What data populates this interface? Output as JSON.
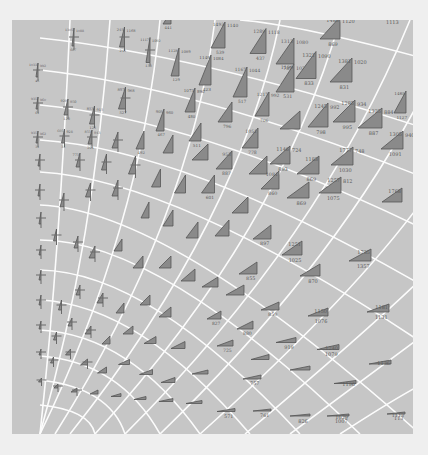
{
  "figure": {
    "background": "#efefef",
    "panel_color": "#c6c6c6",
    "grid_color": "#ffffff",
    "glyph_fill": "#8a8a8a",
    "glyph_stroke": "#555555",
    "label_color": "#5a5a5a"
  },
  "glyphs": [
    {
      "x": 73,
      "y": 37,
      "w": 2,
      "h": 18,
      "top": "1305",
      "right": "1088",
      "bottom": "667"
    },
    {
      "x": 122,
      "y": 37,
      "w": 5,
      "h": 20,
      "top": "245",
      "right": "1168",
      "bottom": "245"
    },
    {
      "x": 148,
      "y": 50,
      "w": 4,
      "h": 25,
      "top": "1117",
      "right": "1092",
      "bottom": "133"
    },
    {
      "x": 175,
      "y": 62,
      "w": 8,
      "h": 28,
      "top": "1128",
      "right": "1089",
      "bottom": "129"
    },
    {
      "x": 167,
      "y": 18,
      "w": 8,
      "h": 12,
      "top": "",
      "right": "",
      "bottom": "441"
    },
    {
      "x": 205,
      "y": 70,
      "w": 12,
      "h": 30,
      "top": "1149",
      "right": "1084",
      "bottom": "423"
    },
    {
      "x": 218,
      "y": 35,
      "w": 14,
      "h": 26,
      "top": "1493",
      "right": "1140",
      "bottom": "539"
    },
    {
      "x": 240,
      "y": 82,
      "w": 14,
      "h": 30,
      "top": "1167",
      "right": "1044",
      "bottom": "517"
    },
    {
      "x": 258,
      "y": 41,
      "w": 16,
      "h": 25,
      "top": "1289",
      "right": "1118",
      "bottom": "437"
    },
    {
      "x": 262,
      "y": 104,
      "w": 14,
      "h": 24,
      "top": "1217",
      "right": "992",
      "bottom": "706"
    },
    {
      "x": 285,
      "y": 51,
      "w": 18,
      "h": 26,
      "top": "1313",
      "right": "1080",
      "bottom": "785"
    },
    {
      "x": 285,
      "y": 78,
      "w": 18,
      "h": 28,
      "top": "1199",
      "right": "1020",
      "bottom": "531"
    },
    {
      "x": 306,
      "y": 65,
      "w": 20,
      "h": 27,
      "top": "1321",
      "right": "1090",
      "bottom": "833"
    },
    {
      "x": 318,
      "y": 115,
      "w": 20,
      "h": 24,
      "top": "1245",
      "right": "992",
      "bottom": "798"
    },
    {
      "x": 341,
      "y": 70,
      "w": 22,
      "h": 24,
      "top": "1381",
      "right": "1020",
      "bottom": "831"
    },
    {
      "x": 330,
      "y": 28,
      "w": 20,
      "h": 22,
      "top": "1485",
      "right": "1120",
      "bottom": "869"
    },
    {
      "x": 344,
      "y": 111,
      "w": 22,
      "h": 22,
      "top": "1285",
      "right": "934",
      "bottom": "995"
    },
    {
      "x": 370,
      "y": 118,
      "w": 24,
      "h": 20,
      "top": "1325",
      "right": "884",
      "bottom": "887"
    },
    {
      "x": 400,
      "y": 102,
      "w": 12,
      "h": 22,
      "top": "1465",
      "right": "",
      "bottom": "1127"
    },
    {
      "x": 392,
      "y": 140,
      "w": 22,
      "h": 18,
      "top": "1305",
      "right": "940",
      "bottom": "1091"
    },
    {
      "x": 37,
      "y": 70,
      "w": 2,
      "h": 14,
      "top": "1033",
      "right": "992",
      "bottom": "45"
    },
    {
      "x": 37,
      "y": 103,
      "w": 2,
      "h": 12,
      "top": "935",
      "right": "960",
      "bottom": "61"
    },
    {
      "x": 66,
      "y": 107,
      "w": 4,
      "h": 16,
      "top": "929",
      "right": "950",
      "bottom": "120"
    },
    {
      "x": 92,
      "y": 115,
      "w": 5,
      "h": 18,
      "top": "853",
      "right": "915",
      "bottom": "125"
    },
    {
      "x": 122,
      "y": 98,
      "w": 7,
      "h": 22,
      "top": "897",
      "right": "968",
      "bottom": "527"
    },
    {
      "x": 160,
      "y": 120,
      "w": 8,
      "h": 22,
      "top": "905",
      "right": "960",
      "bottom": "467"
    },
    {
      "x": 190,
      "y": 100,
      "w": 10,
      "h": 24,
      "top": "1073",
      "right": "890",
      "bottom": "480"
    },
    {
      "x": 225,
      "y": 112,
      "w": 14,
      "h": 20,
      "top": "",
      "right": "",
      "bottom": "796"
    },
    {
      "x": 37,
      "y": 137,
      "w": 2,
      "h": 12,
      "top": "935",
      "right": "962",
      "bottom": "31"
    },
    {
      "x": 63,
      "y": 136,
      "w": 3,
      "h": 14,
      "top": "605",
      "right": "928",
      "bottom": "31"
    },
    {
      "x": 90,
      "y": 137,
      "w": 4,
      "h": 14,
      "top": "853",
      "right": "943",
      "bottom": "201"
    },
    {
      "x": 115,
      "y": 140,
      "w": 6,
      "h": 16,
      "top": "",
      "right": "",
      "bottom": ""
    },
    {
      "x": 140,
      "y": 140,
      "w": 8,
      "h": 18,
      "top": "",
      "right": "",
      "bottom": "492"
    },
    {
      "x": 168,
      "y": 144,
      "w": 10,
      "h": 18,
      "top": "",
      "right": "",
      "bottom": ""
    },
    {
      "x": 195,
      "y": 132,
      "w": 12,
      "h": 18,
      "top": "",
      "right": "",
      "bottom": "511"
    },
    {
      "x": 200,
      "y": 152,
      "w": 16,
      "h": 16,
      "top": "",
      "right": "",
      "bottom": ""
    },
    {
      "x": 39,
      "y": 160,
      "w": 2,
      "h": 12,
      "top": "",
      "right": "",
      "bottom": ""
    },
    {
      "x": 78,
      "y": 160,
      "w": 4,
      "h": 14,
      "top": "773",
      "right": "",
      "bottom": ""
    },
    {
      "x": 104,
      "y": 162,
      "w": 5,
      "h": 16,
      "top": "",
      "right": "",
      "bottom": ""
    },
    {
      "x": 132,
      "y": 165,
      "w": 7,
      "h": 18,
      "top": "",
      "right": "",
      "bottom": ""
    },
    {
      "x": 156,
      "y": 178,
      "w": 9,
      "h": 18,
      "top": "",
      "right": "",
      "bottom": ""
    },
    {
      "x": 180,
      "y": 184,
      "w": 11,
      "h": 18,
      "top": "",
      "right": "",
      "bottom": ""
    },
    {
      "x": 208,
      "y": 184,
      "w": 13,
      "h": 18,
      "top": "",
      "right": "",
      "bottom": "601"
    },
    {
      "x": 224,
      "y": 160,
      "w": 16,
      "h": 18,
      "top": "953",
      "right": "",
      "bottom": "887"
    },
    {
      "x": 250,
      "y": 138,
      "w": 16,
      "h": 20,
      "top": "1051",
      "right": "",
      "bottom": "778"
    },
    {
      "x": 258,
      "y": 165,
      "w": 18,
      "h": 18,
      "top": "",
      "right": "",
      "bottom": ""
    },
    {
      "x": 280,
      "y": 155,
      "w": 20,
      "h": 18,
      "top": "1146",
      "right": "724",
      "bottom": "893"
    },
    {
      "x": 290,
      "y": 120,
      "w": 20,
      "h": 18,
      "top": "",
      "right": "",
      "bottom": ""
    },
    {
      "x": 270,
      "y": 180,
      "w": 18,
      "h": 18,
      "top": "1081",
      "right": "",
      "bottom": "860"
    },
    {
      "x": 308,
      "y": 165,
      "w": 22,
      "h": 18,
      "top": "1183",
      "right": "",
      "bottom": "869"
    },
    {
      "x": 342,
      "y": 156,
      "w": 22,
      "h": 18,
      "top": "1777",
      "right": "748",
      "bottom": "1030"
    },
    {
      "x": 330,
      "y": 185,
      "w": 22,
      "h": 16,
      "top": "1257",
      "right": "812",
      "bottom": "1075"
    },
    {
      "x": 298,
      "y": 190,
      "w": 22,
      "h": 16,
      "top": "",
      "right": "",
      "bottom": "869"
    },
    {
      "x": 392,
      "y": 195,
      "w": 20,
      "h": 14,
      "top": "1768",
      "right": "",
      "bottom": ""
    },
    {
      "x": 39,
      "y": 190,
      "w": 2,
      "h": 12,
      "top": "",
      "right": "",
      "bottom": ""
    },
    {
      "x": 40,
      "y": 218,
      "w": 2,
      "h": 12,
      "top": "",
      "right": "",
      "bottom": ""
    },
    {
      "x": 62,
      "y": 200,
      "w": 4,
      "h": 14,
      "top": "",
      "right": "",
      "bottom": ""
    },
    {
      "x": 88,
      "y": 190,
      "w": 5,
      "h": 14,
      "top": "",
      "right": "",
      "bottom": ""
    },
    {
      "x": 115,
      "y": 188,
      "w": 6,
      "h": 16,
      "top": "",
      "right": "",
      "bottom": ""
    },
    {
      "x": 145,
      "y": 210,
      "w": 8,
      "h": 16,
      "top": "",
      "right": "",
      "bottom": ""
    },
    {
      "x": 168,
      "y": 218,
      "w": 10,
      "h": 16,
      "top": "",
      "right": "",
      "bottom": ""
    },
    {
      "x": 192,
      "y": 230,
      "w": 12,
      "h": 16,
      "top": "",
      "right": "",
      "bottom": ""
    },
    {
      "x": 222,
      "y": 228,
      "w": 14,
      "h": 16,
      "top": "",
      "right": "",
      "bottom": ""
    },
    {
      "x": 240,
      "y": 205,
      "w": 16,
      "h": 16,
      "top": "",
      "right": "",
      "bottom": ""
    },
    {
      "x": 262,
      "y": 232,
      "w": 18,
      "h": 14,
      "top": "",
      "right": "",
      "bottom": "897"
    },
    {
      "x": 292,
      "y": 248,
      "w": 20,
      "h": 14,
      "top": "1251",
      "right": "",
      "bottom": "1025"
    },
    {
      "x": 360,
      "y": 255,
      "w": 22,
      "h": 12,
      "top": "1735",
      "right": "",
      "bottom": "1357"
    },
    {
      "x": 310,
      "y": 270,
      "w": 20,
      "h": 12,
      "top": "",
      "right": "",
      "bottom": "870"
    },
    {
      "x": 248,
      "y": 268,
      "w": 18,
      "h": 12,
      "top": "",
      "right": "",
      "bottom": "855"
    },
    {
      "x": 40,
      "y": 250,
      "w": 2,
      "h": 10,
      "top": "",
      "right": "",
      "bottom": ""
    },
    {
      "x": 40,
      "y": 275,
      "w": 2,
      "h": 10,
      "top": "",
      "right": "",
      "bottom": ""
    },
    {
      "x": 55,
      "y": 235,
      "w": 3,
      "h": 12,
      "top": "",
      "right": "",
      "bottom": ""
    },
    {
      "x": 76,
      "y": 242,
      "w": 4,
      "h": 12,
      "top": "",
      "right": "",
      "bottom": ""
    },
    {
      "x": 92,
      "y": 252,
      "w": 6,
      "h": 12,
      "top": "",
      "right": "",
      "bottom": ""
    },
    {
      "x": 118,
      "y": 245,
      "w": 8,
      "h": 12,
      "top": "",
      "right": "",
      "bottom": ""
    },
    {
      "x": 138,
      "y": 262,
      "w": 10,
      "h": 12,
      "top": "",
      "right": "",
      "bottom": ""
    },
    {
      "x": 165,
      "y": 262,
      "w": 12,
      "h": 12,
      "top": "",
      "right": "",
      "bottom": ""
    },
    {
      "x": 188,
      "y": 275,
      "w": 14,
      "h": 12,
      "top": "",
      "right": "",
      "bottom": ""
    },
    {
      "x": 210,
      "y": 282,
      "w": 16,
      "h": 10,
      "top": "",
      "right": "",
      "bottom": ""
    },
    {
      "x": 235,
      "y": 290,
      "w": 18,
      "h": 10,
      "top": "",
      "right": "",
      "bottom": ""
    },
    {
      "x": 40,
      "y": 300,
      "w": 2,
      "h": 10,
      "top": "",
      "right": "",
      "bottom": ""
    },
    {
      "x": 60,
      "y": 305,
      "w": 3,
      "h": 10,
      "top": "",
      "right": "",
      "bottom": ""
    },
    {
      "x": 78,
      "y": 290,
      "w": 4,
      "h": 10,
      "top": "",
      "right": "",
      "bottom": ""
    },
    {
      "x": 100,
      "y": 298,
      "w": 6,
      "h": 10,
      "top": "",
      "right": "",
      "bottom": ""
    },
    {
      "x": 120,
      "y": 308,
      "w": 8,
      "h": 10,
      "top": "",
      "right": "",
      "bottom": ""
    },
    {
      "x": 145,
      "y": 300,
      "w": 10,
      "h": 10,
      "top": "",
      "right": "",
      "bottom": ""
    },
    {
      "x": 165,
      "y": 312,
      "w": 12,
      "h": 10,
      "top": "",
      "right": "",
      "bottom": ""
    },
    {
      "x": 214,
      "y": 315,
      "w": 14,
      "h": 8,
      "top": "",
      "right": "",
      "bottom": "827"
    },
    {
      "x": 245,
      "y": 325,
      "w": 16,
      "h": 8,
      "top": "",
      "right": "",
      "bottom": "880"
    },
    {
      "x": 270,
      "y": 306,
      "w": 18,
      "h": 8,
      "top": "",
      "right": "",
      "bottom": "850"
    },
    {
      "x": 318,
      "y": 312,
      "w": 20,
      "h": 8,
      "top": "1150",
      "right": "",
      "bottom": "1076"
    },
    {
      "x": 378,
      "y": 308,
      "w": 22,
      "h": 8,
      "top": "1181",
      "right": "",
      "bottom": "1131"
    },
    {
      "x": 40,
      "y": 325,
      "w": 2,
      "h": 8,
      "top": "",
      "right": "",
      "bottom": ""
    },
    {
      "x": 55,
      "y": 336,
      "w": 3,
      "h": 8,
      "top": "",
      "right": "",
      "bottom": ""
    },
    {
      "x": 70,
      "y": 322,
      "w": 4,
      "h": 8,
      "top": "",
      "right": "",
      "bottom": ""
    },
    {
      "x": 88,
      "y": 330,
      "w": 6,
      "h": 8,
      "top": "",
      "right": "",
      "bottom": ""
    },
    {
      "x": 106,
      "y": 340,
      "w": 8,
      "h": 8,
      "top": "",
      "right": "",
      "bottom": ""
    },
    {
      "x": 128,
      "y": 330,
      "w": 10,
      "h": 8,
      "top": "",
      "right": "",
      "bottom": ""
    },
    {
      "x": 150,
      "y": 340,
      "w": 12,
      "h": 7,
      "top": "",
      "right": "",
      "bottom": ""
    },
    {
      "x": 178,
      "y": 345,
      "w": 14,
      "h": 7,
      "top": "",
      "right": "",
      "bottom": ""
    },
    {
      "x": 225,
      "y": 343,
      "w": 16,
      "h": 6,
      "top": "",
      "right": "",
      "bottom": "725"
    },
    {
      "x": 260,
      "y": 357,
      "w": 18,
      "h": 5,
      "top": "",
      "right": "",
      "bottom": ""
    },
    {
      "x": 286,
      "y": 340,
      "w": 20,
      "h": 5,
      "top": "",
      "right": "",
      "bottom": "919"
    },
    {
      "x": 328,
      "y": 347,
      "w": 22,
      "h": 5,
      "top": "1240",
      "right": "",
      "bottom": "1079"
    },
    {
      "x": 380,
      "y": 362,
      "w": 22,
      "h": 4,
      "top": "1136",
      "right": "",
      "bottom": ""
    },
    {
      "x": 40,
      "y": 352,
      "w": 2,
      "h": 6,
      "top": "",
      "right": "",
      "bottom": ""
    },
    {
      "x": 52,
      "y": 360,
      "w": 3,
      "h": 6,
      "top": "",
      "right": "",
      "bottom": ""
    },
    {
      "x": 68,
      "y": 352,
      "w": 5,
      "h": 6,
      "top": "",
      "right": "",
      "bottom": ""
    },
    {
      "x": 84,
      "y": 362,
      "w": 7,
      "h": 6,
      "top": "",
      "right": "",
      "bottom": ""
    },
    {
      "x": 102,
      "y": 370,
      "w": 9,
      "h": 6,
      "top": "",
      "right": "",
      "bottom": ""
    },
    {
      "x": 124,
      "y": 362,
      "w": 11,
      "h": 5,
      "top": "",
      "right": "",
      "bottom": ""
    },
    {
      "x": 146,
      "y": 372,
      "w": 13,
      "h": 5,
      "top": "",
      "right": "",
      "bottom": ""
    },
    {
      "x": 168,
      "y": 380,
      "w": 14,
      "h": 5,
      "top": "",
      "right": "",
      "bottom": ""
    },
    {
      "x": 200,
      "y": 372,
      "w": 16,
      "h": 4,
      "top": "",
      "right": "",
      "bottom": ""
    },
    {
      "x": 252,
      "y": 377,
      "w": 18,
      "h": 4,
      "top": "",
      "right": "",
      "bottom": "757"
    },
    {
      "x": 300,
      "y": 368,
      "w": 20,
      "h": 4,
      "top": "",
      "right": "",
      "bottom": ""
    },
    {
      "x": 345,
      "y": 382,
      "w": 22,
      "h": 3,
      "top": "1196",
      "right": "",
      "bottom": ""
    },
    {
      "x": 40,
      "y": 380,
      "w": 3,
      "h": 4,
      "top": "",
      "right": "",
      "bottom": ""
    },
    {
      "x": 56,
      "y": 386,
      "w": 4,
      "h": 4,
      "top": "",
      "right": "",
      "bottom": ""
    },
    {
      "x": 74,
      "y": 390,
      "w": 6,
      "h": 4,
      "top": "",
      "right": "",
      "bottom": ""
    },
    {
      "x": 94,
      "y": 392,
      "w": 8,
      "h": 4,
      "top": "",
      "right": "",
      "bottom": ""
    },
    {
      "x": 116,
      "y": 395,
      "w": 10,
      "h": 3,
      "top": "",
      "right": "",
      "bottom": ""
    },
    {
      "x": 140,
      "y": 398,
      "w": 12,
      "h": 3,
      "top": "",
      "right": "",
      "bottom": ""
    },
    {
      "x": 166,
      "y": 400,
      "w": 14,
      "h": 3,
      "top": "",
      "right": "",
      "bottom": ""
    },
    {
      "x": 194,
      "y": 402,
      "w": 16,
      "h": 3,
      "top": "",
      "right": "",
      "bottom": ""
    },
    {
      "x": 226,
      "y": 410,
      "w": 18,
      "h": 3,
      "top": "",
      "right": "",
      "bottom": "571"
    },
    {
      "x": 262,
      "y": 410,
      "w": 18,
      "h": 2,
      "top": "",
      "right": "",
      "bottom": "761"
    },
    {
      "x": 300,
      "y": 415,
      "w": 20,
      "h": 2,
      "top": "",
      "right": "",
      "bottom": "826"
    },
    {
      "x": 338,
      "y": 415,
      "w": 22,
      "h": 2,
      "top": "1029",
      "right": "",
      "bottom": "1007"
    },
    {
      "x": 396,
      "y": 413,
      "w": 18,
      "h": 2,
      "top": "1113",
      "right": "",
      "bottom": "113"
    }
  ],
  "corner_label": {
    "x": 386,
    "y": 24,
    "text": "1113"
  }
}
